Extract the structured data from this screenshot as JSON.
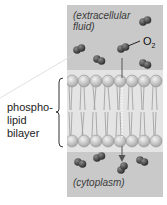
{
  "diagram": {
    "top_region_label_line1": "(extracellular",
    "top_region_label_line2": "fluid)",
    "bottom_region_label": "(cytoplasm)",
    "molecule_label": "O",
    "molecule_subscript": "2",
    "bilayer_label_line1": "phospho-",
    "bilayer_label_line2": "lipid",
    "bilayer_label_line3": "bilayer",
    "colors": {
      "fluid_background": "#c9c9c9",
      "bilayer_background": "#dcdcdc",
      "phospholipid_head": "#bfbfbf",
      "molecule": "#4a4a4a",
      "arrow": "#555555"
    }
  }
}
